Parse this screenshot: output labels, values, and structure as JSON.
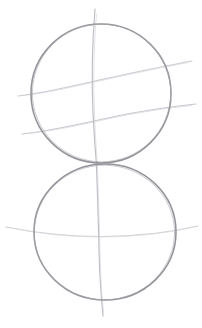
{
  "artwork": {
    "title": "Pencil sketch construction drawing",
    "subject": "two stacked spheres with contour guide lines",
    "medium": "graphite pencil on white paper",
    "background_color": "#ffffff",
    "canvas": {
      "width": 202,
      "height": 328
    }
  },
  "palette": {
    "paper": "#ffffff",
    "circle_stroke": "#8d8d93",
    "circle_stroke_light": "#a5a5ab",
    "guide_stroke": "#c2c2c8",
    "guide_stroke_faint": "#d2d2d8",
    "axis_stroke": "#b6b6bd"
  },
  "strokes": {
    "upper_circle": {
      "name": "upper-sphere-outline",
      "center_x": 101,
      "center_y": 93.5,
      "radius_x": 70,
      "radius_y": 69.5,
      "color": "#8d8d93",
      "width": 1.5
    },
    "lower_circle": {
      "name": "lower-sphere-outline",
      "center_x": 105,
      "center_y": 232,
      "radius_x": 71,
      "radius_y": 68,
      "color": "#8d8d93",
      "width": 1.5
    },
    "vertical_axis": {
      "name": "vertical-center-axis",
      "start_x": 95,
      "start_y": 9,
      "end_x": 103,
      "end_y": 316,
      "color": "#b6b6bd",
      "width": 1.1
    },
    "upper_contour_1": {
      "name": "upper-sphere-contour-upper",
      "start_x": 18,
      "start_y": 96,
      "end_x": 192,
      "end_y": 61,
      "color": "#c2c2c8",
      "width": 1.1
    },
    "upper_contour_2": {
      "name": "upper-sphere-contour-lower",
      "start_x": 22,
      "start_y": 134,
      "end_x": 196,
      "end_y": 104,
      "color": "#c2c2c8",
      "width": 1.1
    },
    "lower_contour_1": {
      "name": "lower-sphere-contour-equator",
      "start_x": 6,
      "start_y": 227,
      "end_x": 198,
      "end_y": 226,
      "color": "#c8c8ce",
      "width": 1.1
    }
  },
  "labels": {
    "figure_caption": "",
    "notes": ""
  }
}
